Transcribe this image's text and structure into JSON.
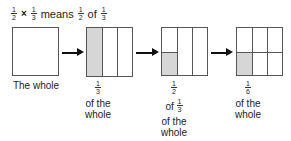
{
  "title": {
    "frac1": {
      "num": "1",
      "den": "2"
    },
    "times": "×",
    "frac2": {
      "num": "1",
      "den": "3"
    },
    "means": "means",
    "frac3": {
      "num": "1",
      "den": "2"
    },
    "of": "of",
    "frac4": {
      "num": "1",
      "den": "3"
    }
  },
  "steps": [
    {
      "caption": "The whole"
    },
    {
      "frac": {
        "num": "1",
        "den": "3"
      },
      "line1": "of the",
      "line2": "whole"
    },
    {
      "frac": {
        "num": "1",
        "den": "2"
      },
      "of": "of",
      "frac2": {
        "num": "1",
        "den": "3"
      },
      "line1": "of the",
      "line2": "whole"
    },
    {
      "frac": {
        "num": "1",
        "den": "6"
      },
      "line1": "of the",
      "line2": "whole"
    }
  ],
  "colors": {
    "shade": "#d6d6d6",
    "border": "#555555",
    "arrow": "#111111"
  }
}
